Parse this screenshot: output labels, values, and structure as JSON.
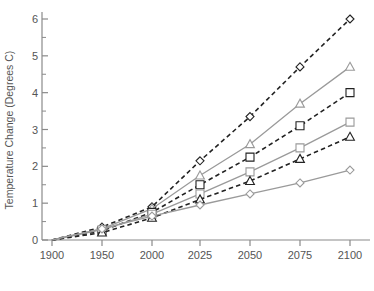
{
  "chart_data": {
    "type": "line",
    "title": "",
    "xlabel": "",
    "ylabel": "Temperature Change (Degrees C)",
    "x": [
      1900,
      1950,
      2000,
      2025,
      2050,
      2075,
      2100
    ],
    "xticklabels": [
      "1900",
      "1950",
      "2000",
      "2025",
      "2050",
      "2075",
      "2100"
    ],
    "yticklabels": [
      "0",
      "1",
      "2",
      "3",
      "4",
      "5",
      "6"
    ],
    "yticks": [
      0,
      1,
      2,
      3,
      4,
      5,
      6
    ],
    "ylim": [
      0,
      6.3
    ],
    "minor_y_ticks": [
      0.5,
      1.5,
      2.5,
      3.5,
      4.5,
      5.5
    ],
    "grid": false,
    "legend": "none",
    "axis_color": "#8a8a8a",
    "dashed_color": "#222222",
    "solid_color": "#9a9a9a",
    "series": [
      {
        "name": "A",
        "marker": "diamond",
        "style": "dashed",
        "color": "#222222",
        "values": [
          0.0,
          0.35,
          0.9,
          2.15,
          3.35,
          4.7,
          6.0
        ]
      },
      {
        "name": "B",
        "marker": "triangle",
        "style": "solid",
        "color": "#9a9a9a",
        "values": [
          0.0,
          0.3,
          0.85,
          1.75,
          2.6,
          3.7,
          4.7
        ]
      },
      {
        "name": "C",
        "marker": "square",
        "style": "dashed",
        "color": "#222222",
        "values": [
          0.0,
          0.25,
          0.75,
          1.5,
          2.25,
          3.1,
          4.0
        ]
      },
      {
        "name": "D",
        "marker": "square",
        "style": "solid",
        "color": "#9a9a9a",
        "values": [
          0.0,
          0.28,
          0.7,
          1.25,
          1.85,
          2.5,
          3.2
        ]
      },
      {
        "name": "E",
        "marker": "triangle",
        "style": "dashed",
        "color": "#222222",
        "values": [
          0.0,
          0.2,
          0.6,
          1.1,
          1.6,
          2.2,
          2.8
        ]
      },
      {
        "name": "F",
        "marker": "diamond",
        "style": "solid",
        "color": "#9a9a9a",
        "values": [
          0.0,
          0.3,
          0.65,
          0.95,
          1.25,
          1.55,
          1.9
        ]
      }
    ]
  }
}
